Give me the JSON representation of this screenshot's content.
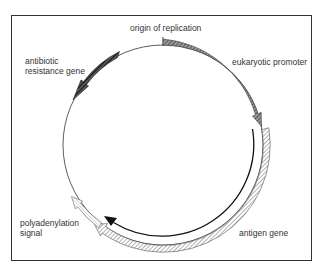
{
  "diagram": {
    "type": "plasmid-map",
    "labels": {
      "origin": "origin of replication",
      "antibiotic_line1": "antibiotic",
      "antibiotic_line2": "resistance gene",
      "promoter": "eukaryotic promoter",
      "polya_line1": "polyadenylation",
      "polya_line2": "signal",
      "antigen": "antigen gene"
    },
    "elements": [
      {
        "name": "origin of replication",
        "kind": "tick",
        "position": "top"
      },
      {
        "name": "eukaryotic promoter",
        "kind": "arrow-band",
        "fill": "dark-hatched",
        "direction": "clockwise"
      },
      {
        "name": "antigen gene",
        "kind": "arrow-band",
        "fill": "light-hatched",
        "direction": "counterclockwise"
      },
      {
        "name": "transcript",
        "kind": "arrow-line",
        "color": "#111111",
        "direction": "counterclockwise"
      },
      {
        "name": "polyadenylation signal",
        "kind": "arrow-band",
        "fill": "open-striped",
        "direction": "counterclockwise"
      },
      {
        "name": "antibiotic resistance gene",
        "kind": "arrow-band",
        "fill": "black-hatched",
        "direction": "counterclockwise"
      }
    ],
    "colors": {
      "frame": "#333333",
      "circle": "#333333",
      "promoter": "#6a6a6a",
      "antigen": "#b5b5b5",
      "antibiotic": "#2a2a2a",
      "polya": "#e8e8e8",
      "transcript": "#111111"
    }
  }
}
